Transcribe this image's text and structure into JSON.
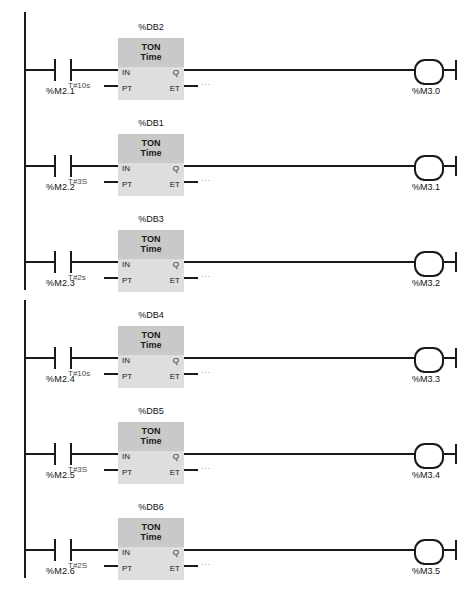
{
  "diagram": {
    "type": "ladder-logic-lad",
    "language": "LAD",
    "caption": "",
    "colors": {
      "line": "#1a1a1a",
      "block_header": "#c9c9c9",
      "block_body": "#dedede",
      "background": "#ffffff",
      "muted_text": "#4a4a4a"
    }
  },
  "groups": [
    {
      "name": "group-1",
      "rungs": [
        {
          "index": 1,
          "db_label": "%DB2",
          "block_title": "TON",
          "block_subtitle": "Time",
          "contact_label": "%M2.1",
          "contact_type": "normally-open",
          "pt_value": "T#10s",
          "et_value": "...",
          "port_in": "IN",
          "port_pt": "PT",
          "port_q": "Q",
          "port_et": "ET",
          "coil_label": "%M3.0",
          "coil_type": "output-coil"
        },
        {
          "index": 2,
          "db_label": "%DB1",
          "block_title": "TON",
          "block_subtitle": "Time",
          "contact_label": "%M2.2",
          "contact_type": "normally-open",
          "pt_value": "T#3S",
          "et_value": "...",
          "port_in": "IN",
          "port_pt": "PT",
          "port_q": "Q",
          "port_et": "ET",
          "coil_label": "%M3.1",
          "coil_type": "output-coil"
        },
        {
          "index": 3,
          "db_label": "%DB3",
          "block_title": "TON",
          "block_subtitle": "Time",
          "contact_label": "%M2.3",
          "contact_type": "normally-open",
          "pt_value": "T#2s",
          "et_value": "...",
          "port_in": "IN",
          "port_pt": "PT",
          "port_q": "Q",
          "port_et": "ET",
          "coil_label": "%M3.2",
          "coil_type": "output-coil"
        }
      ]
    },
    {
      "name": "group-2",
      "rungs": [
        {
          "index": 4,
          "db_label": "%DB4",
          "block_title": "TON",
          "block_subtitle": "Time",
          "contact_label": "%M2.4",
          "contact_type": "normally-open",
          "pt_value": "T#10s",
          "et_value": "...",
          "port_in": "IN",
          "port_pt": "PT",
          "port_q": "Q",
          "port_et": "ET",
          "coil_label": "%M3.3",
          "coil_type": "output-coil"
        },
        {
          "index": 5,
          "db_label": "%DB5",
          "block_title": "TON",
          "block_subtitle": "Time",
          "contact_label": "%M2.5",
          "contact_type": "normally-open",
          "pt_value": "T#3S",
          "et_value": "...",
          "port_in": "IN",
          "port_pt": "PT",
          "port_q": "Q",
          "port_et": "ET",
          "coil_label": "%M3.4",
          "coil_type": "output-coil"
        },
        {
          "index": 6,
          "db_label": "%DB6",
          "block_title": "TON",
          "block_subtitle": "Time",
          "contact_label": "%M2.6",
          "contact_type": "normally-open",
          "pt_value": "T#2S",
          "et_value": "...",
          "port_in": "IN",
          "port_pt": "PT",
          "port_q": "Q",
          "port_et": "ET",
          "coil_label": "%M3.5",
          "coil_type": "output-coil"
        }
      ]
    }
  ]
}
